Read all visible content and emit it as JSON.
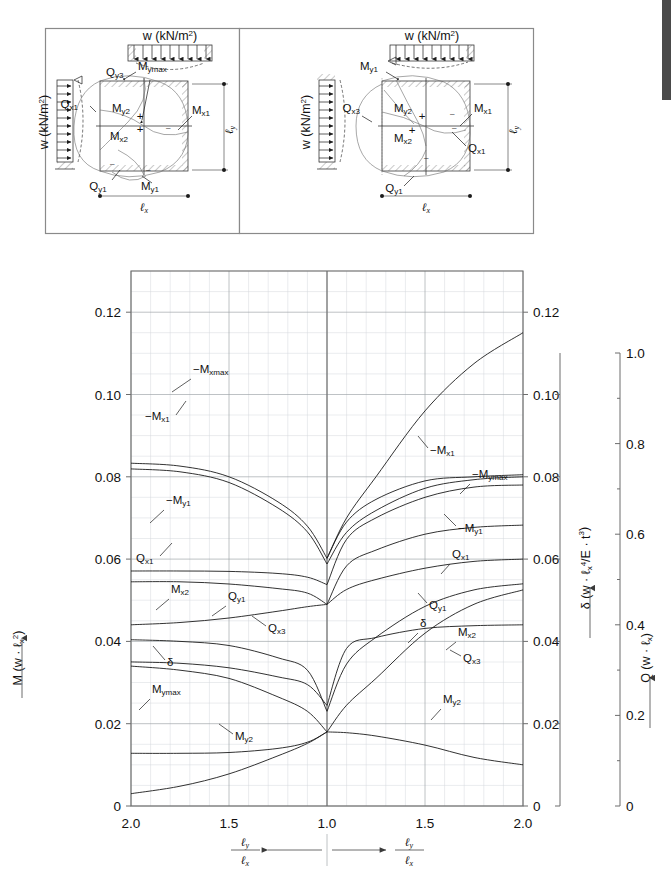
{
  "figure": {
    "kind": "engineering-coefficient-chart",
    "diagrams": [
      {
        "id": "case-left",
        "top_load_label": "w  (kN/m",
        "top_load_sup": "2",
        "top_load_close": ")",
        "side_load_label": "w  (kN/m",
        "side_load_sup": "2",
        "side_load_close": ")",
        "dim_x": "ℓ",
        "dim_x_sub": "x",
        "dim_y": "ℓ",
        "dim_y_sub": "y",
        "annotations": [
          {
            "name": "Q",
            "sub": "y3"
          },
          {
            "name": "M",
            "sub": "ymax"
          },
          {
            "name": "Q",
            "sub": "x1"
          },
          {
            "name": "M",
            "sub": "y2"
          },
          {
            "name": "M",
            "sub": "x1"
          },
          {
            "name": "M",
            "sub": "x2"
          },
          {
            "name": "Q",
            "sub": "y1"
          },
          {
            "name": "M",
            "sub": "y1"
          }
        ]
      },
      {
        "id": "case-right",
        "top_load_label": "w  (kN/m",
        "top_load_sup": "2",
        "top_load_close": ")",
        "side_load_label": "w  (kN/m",
        "side_load_sup": "2",
        "side_load_close": ")",
        "dim_x": "ℓ",
        "dim_x_sub": "x",
        "dim_y": "ℓ",
        "dim_y_sub": "y",
        "annotations": [
          {
            "name": "M",
            "sub": "y1"
          },
          {
            "name": "Q",
            "sub": "x3"
          },
          {
            "name": "M",
            "sub": "y2"
          },
          {
            "name": "M",
            "sub": "x1"
          },
          {
            "name": "M",
            "sub": "x2"
          },
          {
            "name": "Q",
            "sub": "x1"
          },
          {
            "name": "Q",
            "sub": "y1"
          }
        ]
      }
    ]
  },
  "chart_data": {
    "type": "line",
    "title": "",
    "grid": true,
    "legend": "inline-curve-labels",
    "x": {
      "label_numerator": "ℓ",
      "label_numerator_sub": "y",
      "label_denominator": "ℓ",
      "label_denominator_sub": "x",
      "center_value": "1.0",
      "left_branch_ticks": [
        "2.0",
        "1.5",
        "1.0"
      ],
      "right_branch_ticks": [
        "1.0",
        "1.5",
        "2.0"
      ],
      "tick_labels": [
        "2.0",
        "1.5",
        "1.0",
        "1.5",
        "2.0"
      ],
      "tick_positions": [
        0.0,
        0.25,
        0.5,
        0.75,
        1.0
      ],
      "note": "Mirrored axis: left branch runs 2.0→1.0, right branch runs 1.0→2.0"
    },
    "y_left": {
      "label": "M (w · ℓ",
      "label_sub": "x",
      "label_sup": "2",
      "label_close": ")",
      "ticks": [
        0,
        0.02,
        0.04,
        0.06,
        0.08,
        0.1,
        0.12
      ],
      "tick_labels": [
        "0",
        "0.02",
        "0.04",
        "0.06",
        "0.08",
        "0.10",
        "0.12"
      ],
      "range": [
        0,
        0.13
      ]
    },
    "y_right_delta": {
      "label": "δ (w · ℓ",
      "label_sub": "x",
      "label_sup": "4",
      "label_mid": "/E · t",
      "label_sup2": "3",
      "label_close": ")",
      "ticks": [
        0,
        0.02,
        0.04,
        0.06,
        0.08,
        0.1,
        0.12
      ],
      "tick_labels": [
        "0",
        "0.02",
        "0.04",
        "0.06",
        "0.08",
        "0.10",
        "0.12"
      ],
      "range": [
        0,
        0.13
      ]
    },
    "y_right_q": {
      "label": "Q (w · ℓ",
      "label_sub": "x",
      "label_close": ")",
      "ticks": [
        0,
        0.2,
        0.4,
        0.6,
        0.8,
        1.0
      ],
      "tick_labels": [
        "0",
        "0.2",
        "0.4",
        "0.6",
        "0.8",
        "1.0"
      ],
      "range": [
        0,
        1.0
      ]
    },
    "series": [
      {
        "name": "-Mxmax",
        "label": "−M",
        "label_sub": "xmax",
        "axis": "M",
        "x_ratio": [
          2.0,
          1.75,
          1.5,
          1.25,
          1.1,
          1.0
        ],
        "left_values": [
          0.0833,
          0.0826,
          0.08,
          0.0739,
          0.068,
          0.0602
        ],
        "right_values": [
          0.115,
          0.1075,
          0.096,
          0.08,
          0.07,
          0.0602
        ],
        "right_name": "-Mx1"
      },
      {
        "name": "-Mx1",
        "label": "−M",
        "label_sub": "x1",
        "axis": "M",
        "x_ratio": [
          2.0,
          1.75,
          1.5,
          1.25,
          1.1,
          1.0
        ],
        "left_values": [
          0.0819,
          0.0812,
          0.0786,
          0.0724,
          0.0666,
          0.0588
        ],
        "right_values": [
          0.08,
          0.0793,
          0.0772,
          0.0718,
          0.0665,
          0.0588
        ]
      },
      {
        "name": "-Mymax",
        "label": "−M",
        "label_sub": "ymax",
        "axis": "M",
        "x_ratio": [
          1.0,
          1.1,
          1.25,
          1.5,
          1.75,
          2.0
        ],
        "right_values": [
          0.0602,
          0.069,
          0.0745,
          0.079,
          0.08,
          0.0805
        ]
      },
      {
        "name": "-My1",
        "label": "−M",
        "label_sub": "y1",
        "axis": "M",
        "x_ratio": [
          2.0,
          1.75,
          1.5,
          1.25,
          1.1,
          1.0
        ],
        "left_values": [
          0.0571,
          0.0571,
          0.057,
          0.0565,
          0.0556,
          0.0538
        ],
        "right_values": [
          0.078,
          0.0775,
          0.075,
          0.07,
          0.0648,
          0.0538
        ]
      },
      {
        "name": "Qx1",
        "label": "Q",
        "label_sub": "x1",
        "axis": "Q",
        "x_ratio": [
          2.0,
          1.75,
          1.5,
          1.25,
          1.1,
          1.0
        ],
        "left_values": [
          0.495,
          0.495,
          0.49,
          0.48,
          0.47,
          0.445
        ],
        "right_values": [
          0.62,
          0.615,
          0.6,
          0.565,
          0.53,
          0.445
        ]
      },
      {
        "name": "Qy1",
        "label": "Q",
        "label_sub": "y1",
        "axis": "Q",
        "x_ratio": [
          2.0,
          1.75,
          1.5,
          1.25,
          1.1,
          1.0
        ],
        "left_values": [
          0.4,
          0.405,
          0.415,
          0.43,
          0.44,
          0.445
        ],
        "right_values": [
          0.545,
          0.54,
          0.525,
          0.5,
          0.478,
          0.445
        ]
      },
      {
        "name": "Mx2",
        "label": "M",
        "label_sub": "x2",
        "axis": "M",
        "x_ratio": [
          2.0,
          1.75,
          1.5,
          1.25,
          1.1,
          1.0
        ],
        "left_values": [
          0.0404,
          0.04,
          0.039,
          0.036,
          0.033,
          0.023
        ],
        "right_values": [
          0.054,
          0.0525,
          0.0485,
          0.041,
          0.0345,
          0.023
        ]
      },
      {
        "name": "Qx3",
        "label": "Q",
        "label_sub": "x3",
        "axis": "Q",
        "x_ratio": [
          2.0,
          1.75,
          1.5,
          1.25,
          1.1,
          1.0
        ],
        "left_values": [
          0.318,
          0.315,
          0.305,
          0.285,
          0.268,
          0.222
        ],
        "right_values": [
          0.4,
          0.398,
          0.392,
          0.372,
          0.348,
          0.222
        ]
      },
      {
        "name": "δ",
        "label": "δ",
        "label_sub": "",
        "axis": "delta",
        "x_ratio": [
          2.0,
          1.75,
          1.5,
          1.25,
          1.1,
          1.0
        ],
        "left_values": [
          0.034,
          0.033,
          0.031,
          0.0265,
          0.023,
          0.018
        ],
        "right_values": [
          0.0525,
          0.049,
          0.042,
          0.031,
          0.0245,
          0.018
        ]
      },
      {
        "name": "Mymax",
        "label": "M",
        "label_sub": "ymax",
        "axis": "M",
        "x_ratio": [
          2.0,
          1.75,
          1.5,
          1.25,
          1.1,
          1.0
        ],
        "left_values": [
          0.0128,
          0.0128,
          0.013,
          0.014,
          0.0155,
          0.018
        ]
      },
      {
        "name": "My2",
        "label": "M",
        "label_sub": "y2",
        "axis": "M",
        "x_ratio": [
          2.0,
          1.75,
          1.5,
          1.25,
          1.1,
          1.0
        ],
        "left_values": [
          0.003,
          0.0048,
          0.0078,
          0.0122,
          0.0152,
          0.018
        ],
        "right_values": [
          0.01,
          0.0118,
          0.0148,
          0.017,
          0.0178,
          0.018
        ]
      }
    ],
    "curve_labels_left": [
      {
        "text": "−M",
        "sub": "xmax"
      },
      {
        "text": "−M",
        "sub": "x1"
      },
      {
        "text": "−M",
        "sub": "y1"
      },
      {
        "text": "Q",
        "sub": "x1"
      },
      {
        "text": "Q",
        "sub": "y1"
      },
      {
        "text": "M",
        "sub": "x2"
      },
      {
        "text": "Q",
        "sub": "x3"
      },
      {
        "text": "δ",
        "sub": ""
      },
      {
        "text": "M",
        "sub": "ymax"
      },
      {
        "text": "M",
        "sub": "y2"
      }
    ],
    "curve_labels_right": [
      {
        "text": "−M",
        "sub": "x1"
      },
      {
        "text": "−M",
        "sub": "ymax"
      },
      {
        "text": "−M",
        "sub": "y1"
      },
      {
        "text": "Q",
        "sub": "x1"
      },
      {
        "text": "Q",
        "sub": "y1"
      },
      {
        "text": "δ",
        "sub": ""
      },
      {
        "text": "M",
        "sub": "x2"
      },
      {
        "text": "Q",
        "sub": "x3"
      },
      {
        "text": "M",
        "sub": "y2"
      }
    ]
  }
}
